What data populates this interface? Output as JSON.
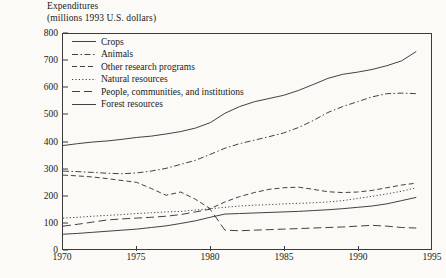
{
  "chart_data": {
    "type": "line",
    "title": "Expenditures\n(millions 1993 U.S. dollars)",
    "title_line1": "Expenditures",
    "title_line2": "(millions 1993 U.S. dollars)",
    "xlabel": "",
    "ylabel": "Expenditures (millions 1993 U.S. dollars)",
    "xlim": [
      1970,
      1995
    ],
    "ylim": [
      0,
      800
    ],
    "grid": false,
    "legend_position": "top-left",
    "xticks": [
      1970,
      1975,
      1980,
      1985,
      1990,
      1995
    ],
    "yticks": [
      0,
      100,
      200,
      300,
      400,
      500,
      600,
      700,
      800
    ],
    "x": [
      1970,
      1971,
      1972,
      1973,
      1974,
      1975,
      1976,
      1977,
      1978,
      1979,
      1980,
      1981,
      1982,
      1983,
      1984,
      1985,
      1986,
      1987,
      1988,
      1989,
      1990,
      1991,
      1992,
      1993,
      1994
    ],
    "series": [
      {
        "name": "Crops",
        "style": "solid",
        "values": [
          385,
          392,
          398,
          402,
          408,
          415,
          420,
          428,
          437,
          450,
          470,
          505,
          530,
          548,
          560,
          572,
          590,
          612,
          635,
          650,
          658,
          668,
          682,
          700,
          735
        ]
      },
      {
        "name": "Animals",
        "style": "dash-dot",
        "values": [
          290,
          288,
          285,
          282,
          280,
          283,
          290,
          300,
          315,
          330,
          352,
          375,
          392,
          405,
          418,
          432,
          452,
          478,
          508,
          530,
          548,
          566,
          578,
          580,
          578
        ]
      },
      {
        "name": "Other research programs",
        "style": "dashed",
        "values": [
          275,
          272,
          268,
          262,
          255,
          248,
          225,
          200,
          212,
          185,
          150,
          175,
          195,
          210,
          222,
          228,
          230,
          222,
          213,
          210,
          212,
          218,
          228,
          238,
          245
        ]
      },
      {
        "name": "Natural resources",
        "style": "dotted",
        "values": [
          115,
          118,
          122,
          125,
          128,
          132,
          135,
          138,
          140,
          145,
          150,
          155,
          160,
          163,
          165,
          168,
          170,
          172,
          175,
          180,
          188,
          196,
          205,
          215,
          228
        ]
      },
      {
        "name": "People, communities, and institutions",
        "style": "long-dash",
        "values": [
          85,
          92,
          100,
          108,
          112,
          115,
          118,
          122,
          128,
          138,
          148,
          70,
          68,
          70,
          72,
          74,
          76,
          78,
          80,
          82,
          85,
          88,
          85,
          80,
          78
        ]
      },
      {
        "name": "Forest resources",
        "style": "solid",
        "values": [
          55,
          58,
          62,
          66,
          70,
          74,
          80,
          86,
          95,
          105,
          118,
          130,
          132,
          134,
          136,
          138,
          140,
          143,
          146,
          150,
          155,
          160,
          168,
          180,
          192
        ]
      }
    ]
  }
}
